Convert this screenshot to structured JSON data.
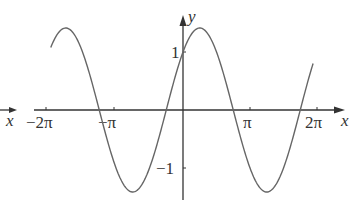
{
  "chart_data": {
    "type": "line",
    "title": "",
    "function": "y = sqrt(2) * sin(x + pi/4)",
    "xlabel": "x",
    "ylabel": "y",
    "x_ticks": [
      "-2π",
      "-π",
      "π",
      "2π"
    ],
    "y_ticks": [
      "1",
      "-1"
    ],
    "xlim": [
      -6.2,
      6.1
    ],
    "ylim": [
      -1.414,
      1.414
    ],
    "series": [
      {
        "name": "curve",
        "x_start": -6.2,
        "x_end": 6.1,
        "amplitude": 1.414,
        "phase": 0.785
      }
    ],
    "grid": false,
    "legend": "none"
  },
  "labels": {
    "x_axis": "x",
    "y_axis": "y",
    "stray_x": "x",
    "tick_neg2pi": "−2π",
    "tick_negpi": "−π",
    "tick_pi": "π",
    "tick_2pi": "2π",
    "tick_1": "1",
    "tick_neg1": "−1"
  },
  "colors": {
    "curve": "#666666",
    "axis": "#333333"
  }
}
